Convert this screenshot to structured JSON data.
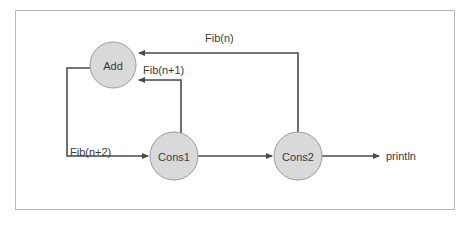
{
  "diagram": {
    "frame": {
      "border_color": "#b9b9b9",
      "background": "#ffffff"
    },
    "style": {
      "node_fill": "#d9d9d9",
      "node_stroke": "#9a9a9a",
      "edge_color": "#4a4a4a",
      "text_color": "#3a3a3a"
    },
    "nodes": [
      {
        "id": "add",
        "label": "Add",
        "cx": 113,
        "cy": 65,
        "r": 23
      },
      {
        "id": "cons1",
        "label": "Cons1",
        "cx": 174,
        "cy": 156,
        "r": 24
      },
      {
        "id": "cons2",
        "label": "Cons2",
        "cx": 298,
        "cy": 156,
        "r": 24
      }
    ],
    "edges": [
      {
        "id": "fib-n",
        "label": "Fib(n)",
        "from": "cons2",
        "to": "add",
        "label_x": 205,
        "label_y": 42
      },
      {
        "id": "fib-n1",
        "label": "Fib(n+1)",
        "from": "cons1",
        "to": "add",
        "label_x": 143,
        "label_y": 74
      },
      {
        "id": "fib-n2",
        "label": "Fib(n+2)",
        "from": "add",
        "to": "cons1",
        "label_x": 70,
        "label_y": 156
      },
      {
        "id": "cons-link",
        "label": "",
        "from": "cons1",
        "to": "cons2",
        "label_x": 0,
        "label_y": 0
      },
      {
        "id": "out",
        "label": "",
        "from": "cons2",
        "to": "println",
        "label_x": 0,
        "label_y": 0
      }
    ],
    "sink": {
      "label": "println",
      "x": 386,
      "y": 160
    }
  }
}
